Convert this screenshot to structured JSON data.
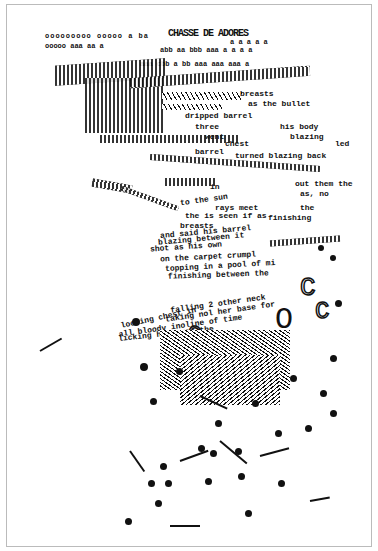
{
  "artwork": {
    "title_glyphs": "CHASSE DE ADORES",
    "frame_color": "#bbbbbb",
    "ink_color": "#111111",
    "text_fragments": [
      {
        "text": "breasts",
        "x": 240,
        "y": 90
      },
      {
        "text": "as the bullet",
        "x": 248,
        "y": 100
      },
      {
        "text": "dripped barrel",
        "x": 185,
        "y": 112
      },
      {
        "text": "three",
        "x": 195,
        "y": 123
      },
      {
        "text": "his body",
        "x": 280,
        "y": 123
      },
      {
        "text": "went",
        "x": 205,
        "y": 133
      },
      {
        "text": "blazing",
        "x": 290,
        "y": 133
      },
      {
        "text": "chest",
        "x": 225,
        "y": 140
      },
      {
        "text": "led",
        "x": 335,
        "y": 140
      },
      {
        "text": "barrel",
        "x": 195,
        "y": 148
      },
      {
        "text": "turned blazing back",
        "x": 235,
        "y": 152
      },
      {
        "text": "out them the",
        "x": 295,
        "y": 180
      },
      {
        "text": "as, no",
        "x": 300,
        "y": 190
      },
      {
        "text": "in",
        "x": 210,
        "y": 183
      },
      {
        "text": "to the sun",
        "x": 180,
        "y": 196
      },
      {
        "text": "rays meet",
        "x": 215,
        "y": 204
      },
      {
        "text": "the",
        "x": 300,
        "y": 204
      },
      {
        "text": "the is seen if as",
        "x": 185,
        "y": 212
      },
      {
        "text": "finishing",
        "x": 268,
        "y": 214
      },
      {
        "text": "breasts",
        "x": 180,
        "y": 222
      },
      {
        "text": "and said his barrel",
        "x": 160,
        "y": 228
      },
      {
        "text": "blazing between it",
        "x": 158,
        "y": 235
      },
      {
        "text": "shot as his own",
        "x": 150,
        "y": 243
      },
      {
        "text": "on the carpet crumpl",
        "x": 160,
        "y": 253
      },
      {
        "text": "topping in a pool of mi",
        "x": 165,
        "y": 262
      },
      {
        "text": "finishing between the",
        "x": 168,
        "y": 271
      },
      {
        "text": "falling 2 other neck",
        "x": 170,
        "y": 300
      },
      {
        "text": "taking nol her base for",
        "x": 165,
        "y": 308
      },
      {
        "text": "looking chest in",
        "x": 120,
        "y": 314
      },
      {
        "text": "all bloody inoline of time",
        "x": 118,
        "y": 322
      },
      {
        "text": "licking his over the",
        "x": 118,
        "y": 330
      },
      {
        "text": "leaves",
        "x": 250,
        "y": 335
      }
    ]
  }
}
